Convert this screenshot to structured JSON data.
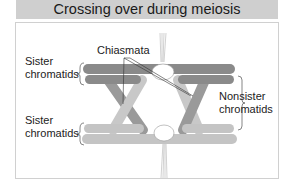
{
  "title": "Crossing over during meiosis",
  "labels": {
    "chiasmata": "Chiasmata",
    "sister_top_line1": "Sister",
    "sister_top_line2": "chromatids",
    "sister_bottom_line1": "Sister",
    "sister_bottom_line2": "chromatids",
    "nonsister_line1": "Nonsister",
    "nonsister_line2": "chromatids"
  },
  "colors": {
    "dark_chromatid": "#8a8a8a",
    "light_chromatid": "#c4c4c4",
    "centromere": "#ffffff",
    "title_bg": "#cfcfcf"
  }
}
